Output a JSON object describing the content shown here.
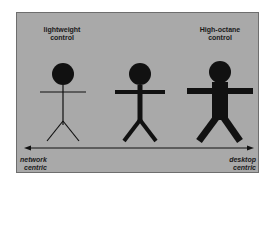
{
  "diagram": {
    "top_labels": {
      "left": [
        "lightweight",
        "control"
      ],
      "right": [
        "High-octane",
        "control"
      ]
    },
    "axis": {
      "left_label": [
        "network",
        "centric"
      ],
      "right_label": [
        "desktop",
        "centric"
      ],
      "direction": "bidirectional"
    },
    "figures": [
      {
        "name": "thin-stick-figure",
        "weight": "light"
      },
      {
        "name": "medium-stick-figure",
        "weight": "medium"
      },
      {
        "name": "thick-stick-figure",
        "weight": "heavy"
      }
    ],
    "colors": {
      "background": "#ffffff",
      "panel": "#a9a9a9",
      "ink": "#111111"
    }
  }
}
